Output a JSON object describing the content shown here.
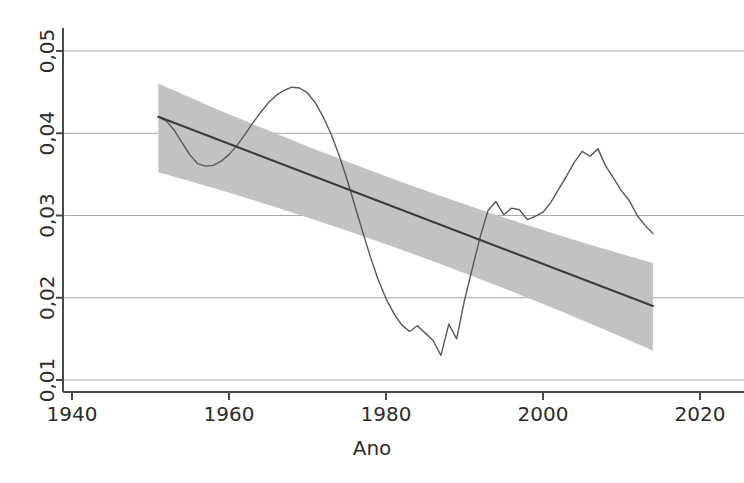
{
  "chart_data": {
    "type": "line",
    "title": "",
    "subtitle": "",
    "xlabel": "Ano",
    "ylabel": "",
    "xlim": [
      1940,
      2020
    ],
    "ylim": [
      0.01,
      0.05
    ],
    "grid": true,
    "grid_axis": "y",
    "legend": "none",
    "x_ticks": [
      1940,
      1960,
      1980,
      2000,
      2020
    ],
    "x_tick_labels": [
      "1940",
      "1960",
      "1980",
      "2000",
      "2020"
    ],
    "y_ticks": [
      0.01,
      0.02,
      0.03,
      0.04,
      0.05
    ],
    "y_tick_labels": [
      "0,01",
      "0,02",
      "0,03",
      "0,04",
      "0,05"
    ],
    "decimal_separator": ",",
    "series": [
      {
        "name": "serie-observada",
        "type": "line",
        "color": "#575757",
        "x": [
          1951,
          1952,
          1953,
          1954,
          1955,
          1956,
          1957,
          1958,
          1959,
          1960,
          1961,
          1962,
          1963,
          1964,
          1965,
          1966,
          1967,
          1968,
          1969,
          1970,
          1971,
          1972,
          1973,
          1974,
          1975,
          1976,
          1977,
          1978,
          1979,
          1980,
          1981,
          1982,
          1983,
          1984,
          1985,
          1986,
          1987,
          1988,
          1989,
          1990,
          1991,
          1992,
          1993,
          1994,
          1995,
          1996,
          1997,
          1998,
          1999,
          2000,
          2001,
          2002,
          2003,
          2004,
          2005,
          2006,
          2007,
          2008,
          2009,
          2010,
          2011,
          2012,
          2013,
          2014
        ],
        "values": [
          0.042,
          0.0415,
          0.0404,
          0.0389,
          0.0374,
          0.0363,
          0.036,
          0.0361,
          0.0366,
          0.0374,
          0.0385,
          0.0398,
          0.0412,
          0.0425,
          0.0437,
          0.0446,
          0.0452,
          0.0456,
          0.0455,
          0.0449,
          0.0437,
          0.042,
          0.0399,
          0.0374,
          0.0345,
          0.0313,
          0.0281,
          0.025,
          0.0222,
          0.0199,
          0.0181,
          0.0167,
          0.0159,
          0.0166,
          0.0157,
          0.0148,
          0.013,
          0.0168,
          0.015,
          0.0197,
          0.0236,
          0.0274,
          0.0306,
          0.0317,
          0.0301,
          0.0309,
          0.0307,
          0.0295,
          0.0299,
          0.0304,
          0.0316,
          0.0332,
          0.0348,
          0.0365,
          0.0378,
          0.0372,
          0.0381,
          0.036,
          0.0345,
          0.033,
          0.0318,
          0.03,
          0.0288,
          0.0278
        ],
        "description": "linha observada: inicia 0,042 em 1951, minimo local 0,036 em 1957, pico 0,0456 em 1968, minimo 0,013 em 1987, pico 0,038 em 1996, queda ate 0,017 em 2011, termina 0,019 em 2014"
      },
      {
        "name": "tendencia-linear",
        "type": "line",
        "color": "#3a3a3a",
        "x": [
          1951,
          2014
        ],
        "values": [
          0.042,
          0.019
        ],
        "description": "reta de tendencia descendente"
      },
      {
        "name": "intervalo-confianca",
        "type": "band",
        "color": "#bebebe",
        "x": [
          1951,
          2014
        ],
        "upper": [
          0.0448,
          0.023
        ],
        "lower": [
          0.0365,
          0.0148
        ],
        "description": "faixa cinza de confianca em torno da tendencia"
      }
    ],
    "annotations": []
  },
  "axis": {
    "x_title": "Ano",
    "y_title": ""
  },
  "colors": {
    "background": "#ffffff",
    "axis": "#4a4a4a",
    "grid": "#a8a8a8",
    "data_line": "#575757",
    "trend_line": "#333333",
    "confidence_band": "#c0c0c0",
    "tick_text": "#2b2b2b"
  }
}
